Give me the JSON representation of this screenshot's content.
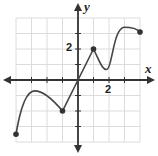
{
  "chart_data": {
    "type": "line",
    "title": "",
    "xlabel": "x",
    "ylabel": "y",
    "xlim": [
      -4,
      4
    ],
    "ylim": [
      -4,
      4
    ],
    "grid": true,
    "tick_labels": {
      "x": [
        "2"
      ],
      "y": [
        "2"
      ]
    },
    "tick_label_positions": {
      "x": [
        2
      ],
      "y": [
        2
      ]
    },
    "series": [
      {
        "name": "f(x)",
        "color": "#444444",
        "points": [
          {
            "x": -4,
            "y": -3.5,
            "marker": "closed"
          },
          {
            "x": -3.5,
            "y": -1.6
          },
          {
            "x": -2.8,
            "y": -0.7
          },
          {
            "x": -2,
            "y": -1.0
          },
          {
            "x": -1,
            "y": -2,
            "marker": "closed"
          },
          {
            "x": 0,
            "y": 0
          },
          {
            "x": 1,
            "y": 2,
            "marker": "closed"
          },
          {
            "x": 1.9,
            "y": 0.7
          },
          {
            "x": 2.5,
            "y": 2.5
          },
          {
            "x": 3,
            "y": 3.4
          },
          {
            "x": 4,
            "y": 3.1,
            "marker": "closed"
          }
        ]
      }
    ],
    "key_points": {
      "left_endpoint": [
        -4,
        -3.5
      ],
      "local_max_1": [
        -2.8,
        -0.7
      ],
      "corner_1": [
        -1,
        -2
      ],
      "corner_2": [
        1,
        2
      ],
      "local_min": [
        1.9,
        0.7
      ],
      "local_max_2": [
        3,
        3.4
      ],
      "right_endpoint": [
        4,
        3.1
      ]
    }
  },
  "labels": {
    "x_axis": "x",
    "y_axis": "y",
    "x_tick": "2",
    "y_tick": "2"
  },
  "colors": {
    "grid": "#dcdcdc",
    "axis": "#333333",
    "curve": "#444444"
  }
}
